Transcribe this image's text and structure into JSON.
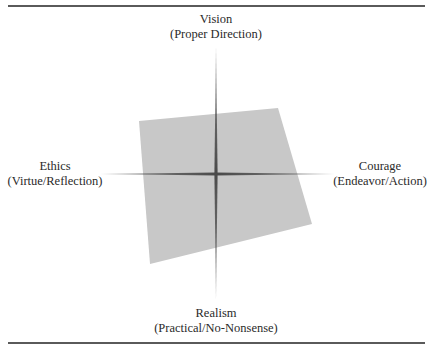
{
  "diagram": {
    "type": "quadrant-axes-with-polygon",
    "axes": {
      "top": {
        "title": "Vision",
        "subtitle": "(Proper Direction)"
      },
      "bottom": {
        "title": "Realism",
        "subtitle": "(Practical/No-Nonsense)"
      },
      "left": {
        "title": "Ethics",
        "subtitle": "(Virtue/Reflection)"
      },
      "right": {
        "title": "Courage",
        "subtitle": "(Endeavor/Action)"
      }
    },
    "polygon": {
      "fill": "#c8c8c8",
      "points": [
        [
          139,
          121
        ],
        [
          278,
          108
        ],
        [
          312,
          224
        ],
        [
          150,
          264
        ]
      ]
    },
    "colors": {
      "axis": "#5a5a5a",
      "rule": "#5a5a5a",
      "polygon": "#c8c8c8",
      "text": "#2a2a2a"
    }
  }
}
